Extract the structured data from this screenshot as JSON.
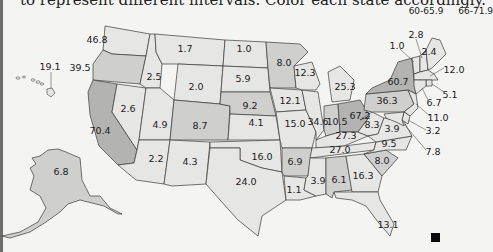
{
  "instruction": {
    "text": "to represent different intervals. Color each state accordingly."
  },
  "legend": {
    "items": [
      "60-65.9",
      "66-71.9"
    ]
  },
  "colors": {
    "light": "#e6e6e4",
    "medium": "#cfcfcd",
    "dark": "#b3b3b1",
    "border": "#3a3a3a"
  },
  "states": {
    "WA": "46.8",
    "OR": "39.5",
    "CA": "70.4",
    "NV": "2.6",
    "ID": "2.5",
    "MT": "1.7",
    "WY": "2.0",
    "UT": "4.9",
    "CO": "8.7",
    "AZ": "2.2",
    "NM": "4.3",
    "ND": "1.0",
    "SD": "5.9",
    "NE": "9.2",
    "KS": "4.1",
    "OK": "16.0",
    "TX": "24.0",
    "MN": "8.0",
    "IA": "12.1",
    "MO": "15.0",
    "AR": "6.9",
    "LA": "1.1",
    "WI": "12.3",
    "IL": "34.6",
    "MI": "25.3",
    "IN": "10.5",
    "OH": "67.2",
    "KY": "27.3",
    "TN": "27.0",
    "MS": "3.9",
    "AL": "6.1",
    "GA": "16.3",
    "FL": "13.1",
    "SC": "8.0",
    "NC": "9.5",
    "WV": "8.3",
    "VA": "3.9",
    "PA": "36.3",
    "NY": "60.7",
    "VT": "1.0",
    "NH": "2.8",
    "ME": "2.4",
    "MA": "12.0",
    "RI": "5.1",
    "CT": "6.7",
    "NJ": "11.0",
    "DE": "3.2",
    "MD": "7.8",
    "HI": "19.1",
    "AK": "6.8"
  }
}
